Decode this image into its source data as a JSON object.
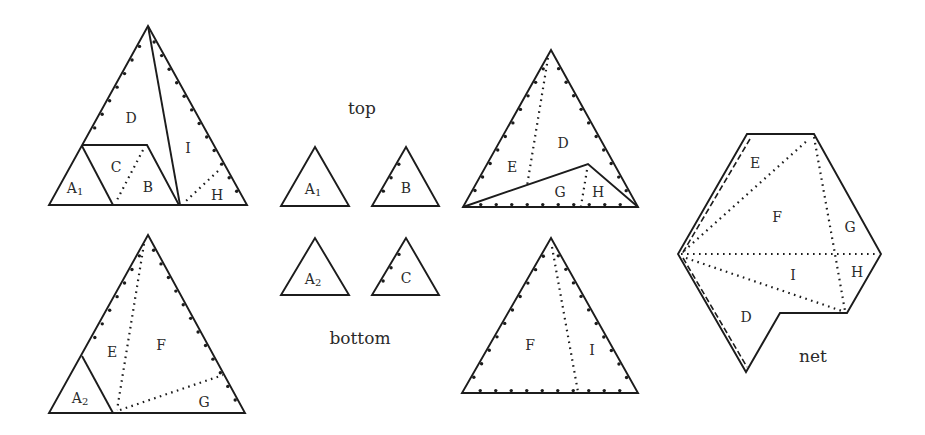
{
  "diagram": {
    "top_original": {
      "labels": {
        "D": "D",
        "I": "I",
        "C": "C",
        "B": "B",
        "H": "H",
        "A1": {
          "letter": "A",
          "sub": "1"
        }
      }
    },
    "bottom_original": {
      "labels": {
        "E": "E",
        "F": "F",
        "G": "G",
        "A2": {
          "letter": "A",
          "sub": "2"
        }
      }
    },
    "pieces": {
      "top_caption": "top",
      "bottom_caption": "bottom",
      "A1": {
        "letter": "A",
        "sub": "1"
      },
      "B": "B",
      "A2": {
        "letter": "A",
        "sub": "2"
      },
      "C": "C"
    },
    "top_reassembled": {
      "labels": {
        "D": "D",
        "E": "E",
        "G": "G",
        "H": "H"
      }
    },
    "bottom_reassembled": {
      "labels": {
        "F": "F",
        "I": "I"
      }
    },
    "net": {
      "caption": "net",
      "labels": {
        "E": "E",
        "F": "F",
        "G": "G",
        "I": "I",
        "H": "H",
        "D": "D"
      }
    },
    "colors": {
      "line": "#1c1c1c",
      "background": "#ffffff"
    }
  }
}
